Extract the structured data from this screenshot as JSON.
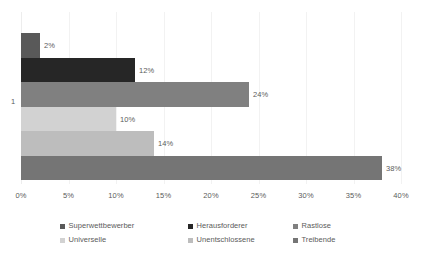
{
  "chart_data": {
    "type": "bar",
    "orientation": "horizontal",
    "title": "",
    "subtitle": "",
    "xlabel": "",
    "ylabel": "",
    "categories": [
      "1"
    ],
    "xlim": [
      0,
      40
    ],
    "x_tick_labels": [
      "0%",
      "5%",
      "10%",
      "15%",
      "20%",
      "25%",
      "30%",
      "35%",
      "40%"
    ],
    "x_tick_values": [
      0,
      5,
      10,
      15,
      20,
      25,
      30,
      35,
      40
    ],
    "grid": true,
    "grid_axis": "x",
    "legend_position": "bottom",
    "data_labels": true,
    "series": [
      {
        "name": "Superwettbewerber",
        "value": 2,
        "label": "2%",
        "color": "#595959"
      },
      {
        "name": "Herausforderer",
        "value": 12,
        "label": "12%",
        "color": "#262626"
      },
      {
        "name": "Rastlose",
        "value": 24,
        "label": "24%",
        "color": "#808080"
      },
      {
        "name": "Universelle",
        "value": 10,
        "label": "10%",
        "color": "#d2d2d2"
      },
      {
        "name": "Unentschlossene",
        "value": 14,
        "label": "14%",
        "color": "#bdbdbd"
      },
      {
        "name": "Treibende",
        "value": 38,
        "label": "38%",
        "color": "#757575"
      }
    ]
  },
  "axis": {
    "category_label": "1",
    "ticks": [
      {
        "label": "0%",
        "value": 0
      },
      {
        "label": "5%",
        "value": 5
      },
      {
        "label": "10%",
        "value": 10
      },
      {
        "label": "15%",
        "value": 15
      },
      {
        "label": "20%",
        "value": 20
      },
      {
        "label": "25%",
        "value": 25
      },
      {
        "label": "30%",
        "value": 30
      },
      {
        "label": "35%",
        "value": 35
      },
      {
        "label": "40%",
        "value": 40
      }
    ]
  },
  "legend": {
    "rows": [
      [
        {
          "label": "Superwettbewerber",
          "color": "#595959"
        },
        {
          "label": "Herausforderer",
          "color": "#262626"
        },
        {
          "label": "Rastlose",
          "color": "#808080"
        }
      ],
      [
        {
          "label": "Universelle",
          "color": "#d2d2d2"
        },
        {
          "label": "Unentschlossene",
          "color": "#bdbdbd"
        },
        {
          "label": "Treibende",
          "color": "#757575"
        }
      ]
    ]
  },
  "style": {
    "text_color": "#5b5b5b",
    "grid_color": "#f2f2f2",
    "background": "#ffffff"
  }
}
